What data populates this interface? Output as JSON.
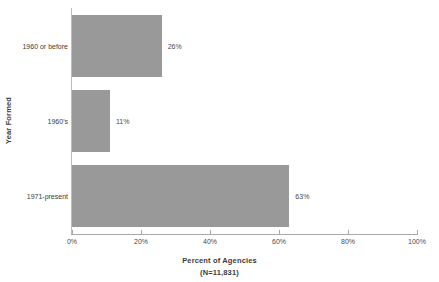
{
  "chart_data": {
    "type": "bar",
    "orientation": "horizontal",
    "title": "",
    "xlabel": "Percent of Agencies",
    "xsublabel": "(N=11,831)",
    "ylabel": "Year Formed",
    "categories": [
      "1960 or before",
      "1960's",
      "1971-present"
    ],
    "values": [
      26,
      11,
      63
    ],
    "data_labels": [
      "26%",
      "11%",
      "63%"
    ],
    "xlim": [
      0,
      100
    ],
    "xticks": [
      0,
      20,
      40,
      60,
      80,
      100
    ],
    "xtick_labels": [
      "0%",
      "20%",
      "40%",
      "60%",
      "80%",
      "100%"
    ],
    "grid": false,
    "legend": false,
    "bar_color": "#999999",
    "axis_color": "#a9a9a9",
    "text_color": "#3b3b3b",
    "background": "#ffffff"
  }
}
